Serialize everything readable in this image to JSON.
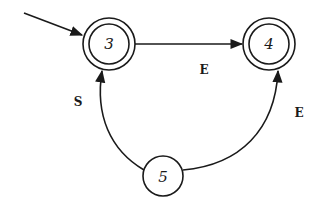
{
  "diagram": {
    "type": "finite-state-automaton",
    "states": [
      {
        "id": "3",
        "label": "3",
        "accepting": true,
        "initial": true,
        "cx": 109,
        "cy": 44
      },
      {
        "id": "4",
        "label": "4",
        "accepting": true,
        "initial": false,
        "cx": 269,
        "cy": 44
      },
      {
        "id": "5",
        "label": "5",
        "accepting": false,
        "initial": false,
        "cx": 163,
        "cy": 176
      }
    ],
    "transitions": [
      {
        "from": "3",
        "to": "4",
        "label": "E"
      },
      {
        "from": "5",
        "to": "3",
        "label": "S"
      },
      {
        "from": "5",
        "to": "4",
        "label": "E"
      }
    ],
    "colors": {
      "stroke": "#1a1a1a",
      "background": "#ffffff"
    }
  }
}
